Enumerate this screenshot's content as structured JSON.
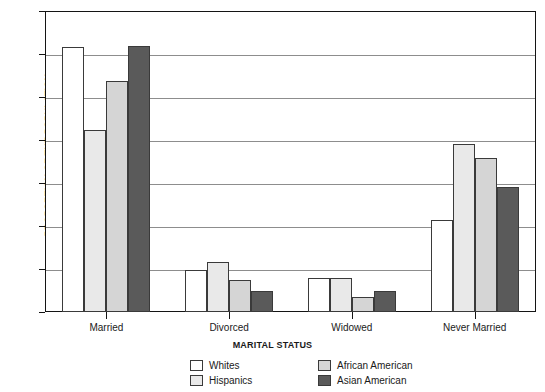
{
  "chart_data": {
    "type": "bar",
    "title": "",
    "xlabel": "MARITAL STATUS",
    "ylabel": "PROPORTION OF THE POPULATION",
    "categories": [
      "Married",
      "Divorced",
      "Widowed",
      "Never Married"
    ],
    "series": [
      {
        "name": "Whites",
        "color": "#ffffff",
        "values": [
          61.6,
          9.8,
          7.8,
          21.5
        ]
      },
      {
        "name": "Hispanics",
        "color": "#e9e9e9",
        "values": [
          42.4,
          11.6,
          7.9,
          39.1
        ]
      },
      {
        "name": "African American",
        "color": "#d5d5d5",
        "values": [
          53.7,
          7.4,
          3.6,
          35.7
        ]
      },
      {
        "name": "Asian American",
        "color": "#5a5a5a",
        "values": [
          61.8,
          5.0,
          4.8,
          29.0
        ]
      }
    ],
    "ylim": [
      0,
      70
    ],
    "ytick_values": [
      0,
      10,
      20,
      30,
      40,
      50,
      60,
      70
    ],
    "ytick_labels": [
      "0",
      "10",
      "20",
      "30",
      "40",
      "50",
      "60",
      "70"
    ],
    "grid": true,
    "legend_position": "bottom",
    "bar_outline_color": "#3a3a3a",
    "axis_color": "#141414",
    "gridline_color": "#8d8d8d"
  }
}
